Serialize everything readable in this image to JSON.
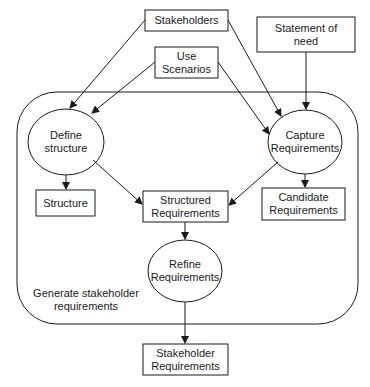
{
  "diagram": {
    "container": {
      "label": "Generate stakeholder\nrequirements"
    },
    "inputs": {
      "stakeholders": "Stakeholders",
      "use_scenarios": "Use\nScenarios",
      "statement_of_need": "Statement of\nneed"
    },
    "processes": {
      "define_structure": "Define\nstructure",
      "capture_requirements": "Capture\nRequirements",
      "refine_requirements": "Refine\nRequirements"
    },
    "artifacts": {
      "structure": "Structure",
      "structured_requirements": "Structured\nRequirements",
      "candidate_requirements": "Candidate\nRequirements",
      "stakeholder_requirements": "Stakeholder\nRequirements"
    },
    "edges": [
      {
        "from": "Stakeholders",
        "to": "Define structure"
      },
      {
        "from": "Stakeholders",
        "to": "Capture Requirements"
      },
      {
        "from": "Use Scenarios",
        "to": "Define structure"
      },
      {
        "from": "Use Scenarios",
        "to": "Capture Requirements"
      },
      {
        "from": "Statement of need",
        "to": "Capture Requirements"
      },
      {
        "from": "Define structure",
        "to": "Structure"
      },
      {
        "from": "Define structure",
        "to": "Structured Requirements"
      },
      {
        "from": "Capture Requirements",
        "to": "Structured Requirements"
      },
      {
        "from": "Capture Requirements",
        "to": "Candidate Requirements"
      },
      {
        "from": "Structured Requirements",
        "to": "Refine Requirements"
      },
      {
        "from": "Refine Requirements",
        "to": "Stakeholder Requirements"
      }
    ],
    "colors": {
      "stroke": "#1a1a1a",
      "background": "#ffffff"
    }
  }
}
